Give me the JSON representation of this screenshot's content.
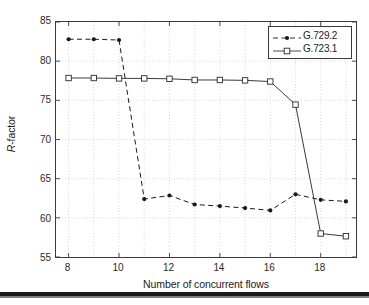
{
  "chart_data": {
    "type": "line",
    "title": "",
    "subtitle": "",
    "xlabel": "Number of concurrent flows",
    "ylabel": "R-factor",
    "ylabel_parts": {
      "italic": "R",
      "rest": "-factor"
    },
    "xlim": [
      7.5,
      19.4
    ],
    "ylim": [
      55,
      85
    ],
    "xticks": [
      8,
      10,
      12,
      14,
      16,
      18
    ],
    "xtick_labels": [
      "8",
      "10",
      "12",
      "14",
      "16",
      "18"
    ],
    "xticks_minor": [
      9,
      11,
      13,
      15,
      17,
      19
    ],
    "yticks": [
      55,
      60,
      65,
      70,
      75,
      80,
      85
    ],
    "ytick_labels": [
      "55",
      "60",
      "65",
      "70",
      "75",
      "80",
      "85"
    ],
    "grid": true,
    "grid_style": "dotted",
    "legend_position": "top-right",
    "x": [
      8,
      9,
      10,
      11,
      12,
      13,
      14,
      15,
      16,
      17,
      18,
      19
    ],
    "series": [
      {
        "name": "G.729.2",
        "line_style": "dashed",
        "marker": "filled-circle",
        "color": "#1a1a1a",
        "values": [
          82.8,
          82.8,
          82.7,
          62.4,
          62.85,
          61.7,
          61.5,
          61.25,
          60.95,
          63.0,
          62.3,
          62.1
        ]
      },
      {
        "name": "G.723.1",
        "line_style": "solid",
        "marker": "open-square",
        "color": "#3a3a3a",
        "values": [
          77.85,
          77.85,
          77.8,
          77.8,
          77.75,
          77.6,
          77.6,
          77.55,
          77.4,
          74.45,
          58.0,
          57.65
        ]
      }
    ]
  },
  "legend": {
    "entries": [
      {
        "label": "G.729.2"
      },
      {
        "label": "G.723.1"
      }
    ]
  }
}
